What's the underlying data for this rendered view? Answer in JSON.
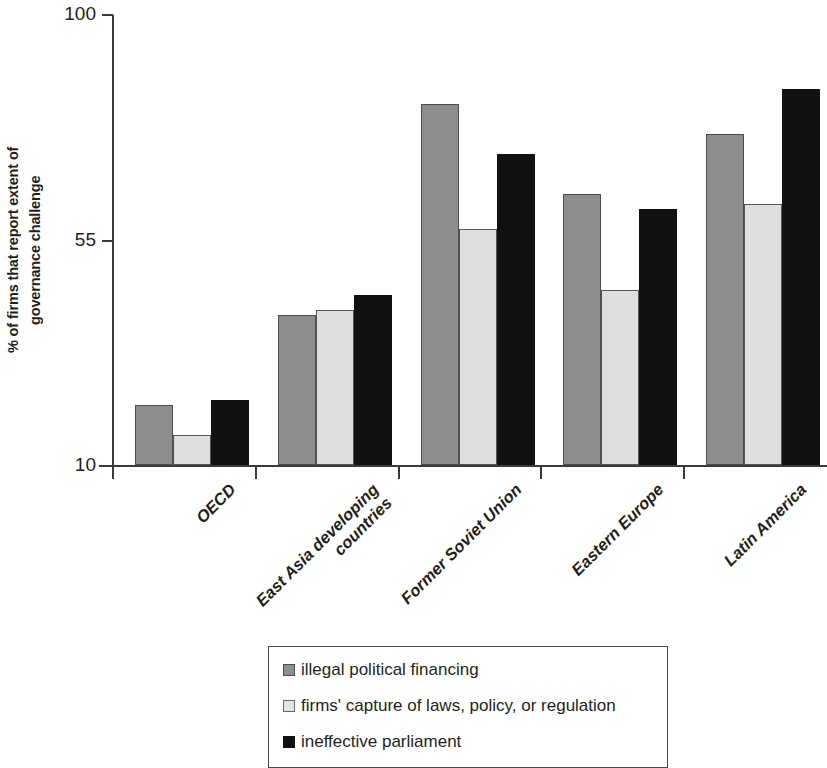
{
  "chart_data": {
    "type": "bar",
    "title": "",
    "subtitle": "",
    "xlabel": "",
    "ylabel": "% of firms that report extent of governance challenge",
    "ylabel_lines": [
      "% of firms that report extent of",
      "governance challenge"
    ],
    "ylim": [
      10,
      100
    ],
    "yticks": [
      10,
      55,
      100
    ],
    "ytick_labels": [
      "10",
      "55",
      "100"
    ],
    "grid": false,
    "legend_position": "bottom",
    "categories": [
      "OECD",
      "East Asia developing countries",
      "Former Soviet Union",
      "Eastern Europe",
      "Latin America"
    ],
    "category_lines": [
      [
        "OECD"
      ],
      [
        "East Asia developing",
        "countries"
      ],
      [
        "Former Soviet Union"
      ],
      [
        "Eastern Europe"
      ],
      [
        "Latin America"
      ]
    ],
    "series": [
      {
        "name": "illegal political financing",
        "color": "#8e8e8e",
        "values": [
          22,
          40,
          82,
          64,
          76
        ]
      },
      {
        "name": "firms' capture of laws, policy, or regulation",
        "color": "#dedede",
        "values": [
          16,
          41,
          57,
          45,
          62
        ]
      },
      {
        "name": "ineffective parliament",
        "color": "#111111",
        "values": [
          23,
          44,
          72,
          61,
          85
        ]
      }
    ]
  },
  "legend": {
    "items": [
      {
        "label": "illegal political financing",
        "swatch": "legend-swatch-gray"
      },
      {
        "label": "firms' capture of laws, policy, or regulation",
        "swatch": "legend-swatch-light"
      },
      {
        "label": "ineffective parliament",
        "swatch": "legend-swatch-black"
      }
    ]
  }
}
